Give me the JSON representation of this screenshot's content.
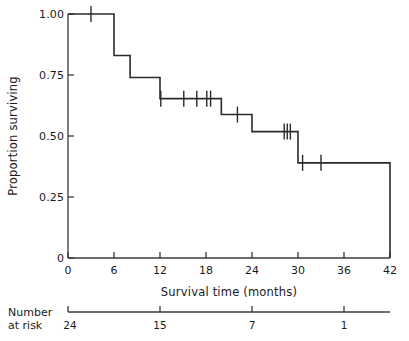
{
  "chart_data": {
    "type": "line",
    "subtype": "kaplan-meier-step",
    "title": "",
    "xlabel": "Survival time (months)",
    "ylabel": "Proportion surviving",
    "xlim": [
      0,
      42
    ],
    "ylim": [
      0,
      1.0
    ],
    "grid": false,
    "legend": null,
    "xticks": [
      0,
      6,
      12,
      18,
      24,
      30,
      36,
      42
    ],
    "xtick_labels": [
      "0",
      "6",
      "12",
      "18",
      "24",
      "30",
      "36",
      "42"
    ],
    "yticks": [
      0,
      0.25,
      0.5,
      0.75,
      1.0
    ],
    "ytick_labels": [
      "0",
      "0.25",
      "0.50",
      "0.75",
      "1.00"
    ],
    "series": [
      {
        "name": "Survival",
        "step_points": [
          {
            "x": 0,
            "y": 1.0
          },
          {
            "x": 6,
            "y": 1.0
          },
          {
            "x": 6,
            "y": 0.83
          },
          {
            "x": 8.1,
            "y": 0.83
          },
          {
            "x": 8.1,
            "y": 0.74
          },
          {
            "x": 12,
            "y": 0.74
          },
          {
            "x": 12,
            "y": 0.653
          },
          {
            "x": 20,
            "y": 0.653
          },
          {
            "x": 20,
            "y": 0.588
          },
          {
            "x": 24,
            "y": 0.588
          },
          {
            "x": 24,
            "y": 0.518
          },
          {
            "x": 30,
            "y": 0.518
          },
          {
            "x": 30,
            "y": 0.39
          },
          {
            "x": 42,
            "y": 0.39
          },
          {
            "x": 42,
            "y": 0
          }
        ],
        "censored": [
          {
            "x": 3.0,
            "y": 1.0
          },
          {
            "x": 12.1,
            "y": 0.653
          },
          {
            "x": 15.1,
            "y": 0.653
          },
          {
            "x": 16.8,
            "y": 0.653
          },
          {
            "x": 18.1,
            "y": 0.653
          },
          {
            "x": 18.6,
            "y": 0.653
          },
          {
            "x": 22.1,
            "y": 0.588
          },
          {
            "x": 28.2,
            "y": 0.518
          },
          {
            "x": 28.6,
            "y": 0.518
          },
          {
            "x": 29.0,
            "y": 0.518
          },
          {
            "x": 30.6,
            "y": 0.39
          },
          {
            "x": 33.0,
            "y": 0.39
          }
        ]
      }
    ],
    "risk_table": {
      "caption_line1": "Number",
      "caption_line2": "at risk",
      "times": [
        0,
        12,
        24,
        36
      ],
      "counts": [
        "24",
        "15",
        "7",
        "1"
      ]
    }
  },
  "colors": {
    "curve": "#2b2b2b",
    "axis": "#3a3a3a",
    "text": "#1a1a1a",
    "background": "#ffffff"
  }
}
